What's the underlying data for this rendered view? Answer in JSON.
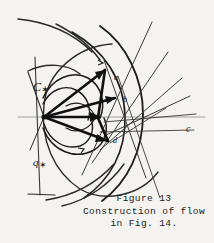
{
  "figure": {
    "caption": {
      "line1": "Figure 13",
      "line2": "Construction of flow",
      "line3": "in Fig. 14."
    },
    "labels": {
      "c_star": "C",
      "c_star_mark": "✶",
      "q_star": "q",
      "q_star_mark": "✶",
      "c_right": "c",
      "point_a": "a",
      "point_b": "b",
      "point_d": "d"
    },
    "colors": {
      "background": "#f4f3f0",
      "ink": "#1c1c1c",
      "ink_light": "#5a5a5a"
    }
  }
}
